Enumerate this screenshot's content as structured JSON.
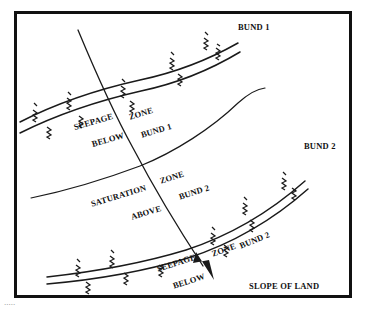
{
  "figure": {
    "frame": {
      "border_color": "#111111",
      "background": "#ffffff"
    },
    "ink_color": "#1a1a1a"
  },
  "labels": {
    "bund_1_top": "BUND 1",
    "bund_2_right": "BUND 2",
    "seepage_upper_word1": "SEEPAGE",
    "seepage_upper_word2": "ZONE",
    "seepage_upper_word3": "BELOW",
    "seepage_upper_word4": "BUND 1",
    "saturation_word1": "SATURATION",
    "saturation_word2": "ZONE",
    "saturation_word3": "ABOVE",
    "saturation_word4": "BUND 2",
    "seepage_lower_word1": "SEEPAGE",
    "seepage_lower_word2": "ZONE",
    "seepage_lower_word3": "BELOW",
    "seepage_lower_word4": "BUND 2",
    "slope_of_land": "SLOPE OF LAND"
  },
  "caption": {
    "clipped_text": "....."
  },
  "elements": {
    "bund_1_name": "bund-1-embankment",
    "bund_2_name": "bund-2-embankment",
    "saturation_boundary_name": "saturation-boundary-curve",
    "slope_arrow_name": "slope-of-land-arrow",
    "vegetation_name": "vegetation-tuft"
  }
}
